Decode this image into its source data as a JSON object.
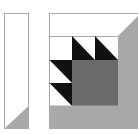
{
  "diagram": {
    "type": "quilt-block",
    "colors": {
      "background": "#ffffff",
      "outline": "#a8a8a8",
      "black": "#111111",
      "dark_gray": "#6a6a6a",
      "light_gray": "#a9a9a9",
      "white": "#ffffff"
    },
    "pieces": {
      "side_strip": {
        "label": "side strip"
      },
      "main_block": {
        "label": "basket block"
      }
    }
  }
}
